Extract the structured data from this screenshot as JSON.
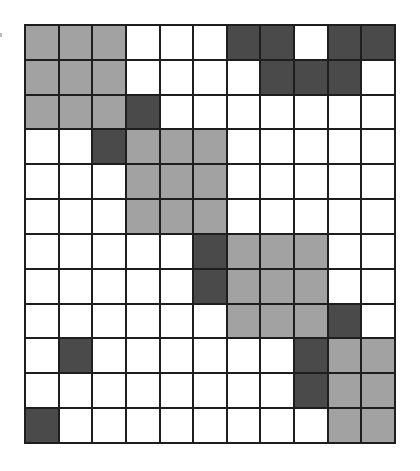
{
  "diagram": {
    "type": "grid",
    "rows": 12,
    "cols": 11,
    "legend_codes": {
      "W": "white",
      "L": "light-gray",
      "D": "dark-gray"
    },
    "colors": {
      "W": "#ffffff",
      "L": "#a2a2a2",
      "D": "#4a4a4a",
      "grid_line": "#1e1e1e"
    },
    "cells": [
      [
        "L",
        "L",
        "L",
        "W",
        "W",
        "W",
        "D",
        "D",
        "W",
        "D",
        "D"
      ],
      [
        "L",
        "L",
        "L",
        "W",
        "W",
        "W",
        "W",
        "D",
        "D",
        "D",
        "W"
      ],
      [
        "L",
        "L",
        "L",
        "D",
        "W",
        "W",
        "W",
        "W",
        "W",
        "W",
        "W"
      ],
      [
        "W",
        "W",
        "D",
        "L",
        "L",
        "L",
        "W",
        "W",
        "W",
        "W",
        "W"
      ],
      [
        "W",
        "W",
        "W",
        "L",
        "L",
        "L",
        "W",
        "W",
        "W",
        "W",
        "W"
      ],
      [
        "W",
        "W",
        "W",
        "L",
        "L",
        "L",
        "W",
        "W",
        "W",
        "W",
        "W"
      ],
      [
        "W",
        "W",
        "W",
        "W",
        "W",
        "D",
        "L",
        "L",
        "L",
        "W",
        "W"
      ],
      [
        "W",
        "W",
        "W",
        "W",
        "W",
        "D",
        "L",
        "L",
        "L",
        "W",
        "W"
      ],
      [
        "W",
        "W",
        "W",
        "W",
        "W",
        "W",
        "L",
        "L",
        "L",
        "D",
        "W"
      ],
      [
        "W",
        "D",
        "W",
        "W",
        "W",
        "W",
        "W",
        "W",
        "D",
        "L",
        "L"
      ],
      [
        "W",
        "W",
        "W",
        "W",
        "W",
        "W",
        "W",
        "W",
        "D",
        "L",
        "L"
      ],
      [
        "D",
        "W",
        "W",
        "W",
        "W",
        "W",
        "W",
        "W",
        "W",
        "L",
        "L"
      ]
    ]
  }
}
